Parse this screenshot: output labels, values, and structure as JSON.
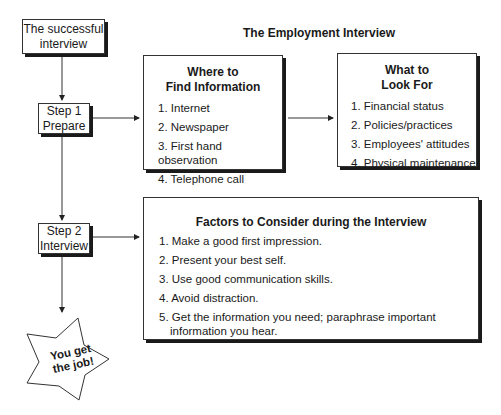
{
  "diagram": {
    "title": "The Employment Interview",
    "start": {
      "label_line1": "The successful",
      "label_line2": "interview"
    },
    "step1": {
      "label_line1": "Step 1",
      "label_line2": "Prepare"
    },
    "step2": {
      "label_line1": "Step 2",
      "label_line2": "Interview"
    },
    "where_box": {
      "heading_line1": "Where to",
      "heading_line2": "Find Information",
      "items": [
        "1. Internet",
        "2. Newspaper",
        "3. First hand observation",
        "4. Telephone call"
      ]
    },
    "what_box": {
      "heading_line1": "What to",
      "heading_line2": "Look For",
      "items": [
        "1. Financial status",
        "2. Policies/practices",
        "3. Employees' attitudes",
        "4. Physical maintenance"
      ]
    },
    "factors_box": {
      "heading": "Factors to Consider during the Interview",
      "items": [
        "1. Make a good first impression.",
        "2. Present your best self.",
        "3. Use good communication skills.",
        "4. Avoid distraction.",
        "5. Get the information you need; paraphrase important information you hear."
      ]
    },
    "outcome": {
      "label_line1": "You get",
      "label_line2": "the job!"
    }
  }
}
